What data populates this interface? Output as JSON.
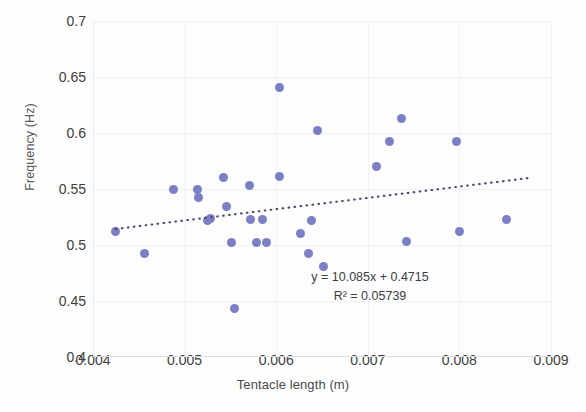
{
  "chart_data": {
    "type": "scatter",
    "title": "",
    "xlabel": "Tentacle length (m)",
    "ylabel": "Frequency (Hz)",
    "xlim": [
      0.004,
      0.009
    ],
    "ylim": [
      0.4,
      0.7
    ],
    "xticks": [
      "0.004",
      "0.005",
      "0.006",
      "0.007",
      "0.008",
      "0.009"
    ],
    "xtick_values": [
      0.004,
      0.005,
      0.006,
      0.007,
      0.008,
      0.009
    ],
    "yticks": [
      "0.4",
      "0.45",
      "0.5",
      "0.55",
      "0.6",
      "0.65",
      "0.7"
    ],
    "ytick_values": [
      0.4,
      0.45,
      0.5,
      0.55,
      0.6,
      0.65,
      0.7
    ],
    "grid": true,
    "legend": false,
    "point_color": "#7b7fc4",
    "trendline_color": "#4a4a6a",
    "trendline_style": "dotted",
    "annotations": {
      "equation": "y = 10.085x + 0.4715",
      "r_squared": "R² = 0.05739"
    },
    "trendline": {
      "slope": 10.085,
      "intercept": 0.4715,
      "r2": 0.05739,
      "x_start": 0.00425,
      "x_end": 0.0088
    },
    "points": [
      {
        "x": 0.00425,
        "y": 0.512
      },
      {
        "x": 0.00456,
        "y": 0.492
      },
      {
        "x": 0.00488,
        "y": 0.55
      },
      {
        "x": 0.00514,
        "y": 0.55
      },
      {
        "x": 0.00515,
        "y": 0.542
      },
      {
        "x": 0.00525,
        "y": 0.522
      },
      {
        "x": 0.00528,
        "y": 0.524
      },
      {
        "x": 0.00543,
        "y": 0.56
      },
      {
        "x": 0.00546,
        "y": 0.534
      },
      {
        "x": 0.00551,
        "y": 0.502
      },
      {
        "x": 0.00555,
        "y": 0.443
      },
      {
        "x": 0.00571,
        "y": 0.553
      },
      {
        "x": 0.00572,
        "y": 0.523
      },
      {
        "x": 0.00578,
        "y": 0.502
      },
      {
        "x": 0.00585,
        "y": 0.523
      },
      {
        "x": 0.00589,
        "y": 0.502
      },
      {
        "x": 0.00604,
        "y": 0.641
      },
      {
        "x": 0.00604,
        "y": 0.561
      },
      {
        "x": 0.00626,
        "y": 0.51
      },
      {
        "x": 0.00635,
        "y": 0.492
      },
      {
        "x": 0.00639,
        "y": 0.522
      },
      {
        "x": 0.00645,
        "y": 0.602
      },
      {
        "x": 0.00652,
        "y": 0.481
      },
      {
        "x": 0.0071,
        "y": 0.57
      },
      {
        "x": 0.00724,
        "y": 0.592
      },
      {
        "x": 0.00737,
        "y": 0.613
      },
      {
        "x": 0.00742,
        "y": 0.503
      },
      {
        "x": 0.00797,
        "y": 0.592
      },
      {
        "x": 0.008,
        "y": 0.512
      },
      {
        "x": 0.00851,
        "y": 0.523
      }
    ]
  }
}
